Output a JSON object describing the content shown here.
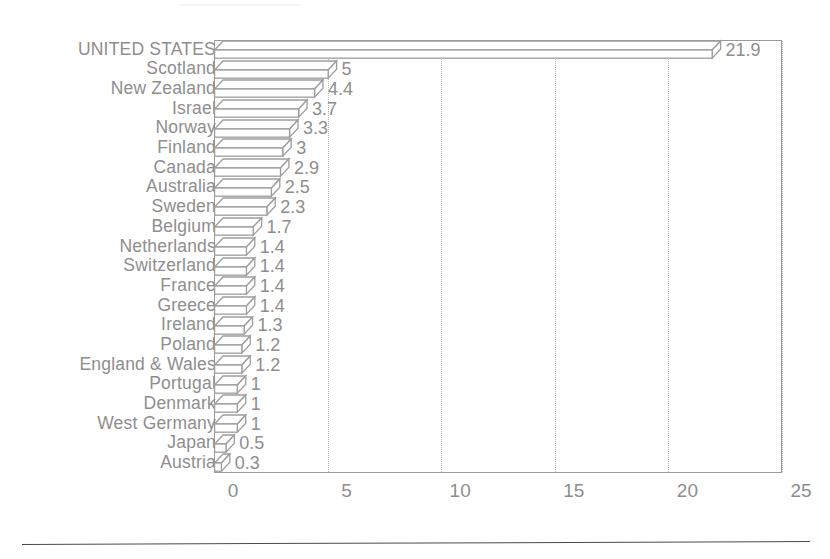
{
  "chart_data": {
    "type": "bar",
    "orientation": "horizontal",
    "title": "",
    "subtitle": "",
    "xlabel": "",
    "ylabel": "",
    "xlim": [
      0,
      25
    ],
    "grid": "dotted vertical gridlines at each x tick",
    "legend": "none",
    "x_ticks": [
      "0",
      "5",
      "10",
      "15",
      "20",
      "25"
    ],
    "x_tick_values": [
      0,
      5,
      10,
      15,
      20,
      25
    ],
    "categories": [
      "UNITED STATES",
      "Scotland",
      "New Zealand",
      "Israel",
      "Norway",
      "Finland",
      "Canada",
      "Australia",
      "Sweden",
      "Belgium",
      "Netherlands",
      "Switzerland",
      "France",
      "Greece",
      "Ireland",
      "Poland",
      "England & Wales",
      "Portugal",
      "Denmark",
      "West Germany",
      "Japan",
      "Austria"
    ],
    "values": [
      21.9,
      5,
      4.4,
      3.7,
      3.3,
      3,
      2.9,
      2.5,
      2.3,
      1.7,
      1.4,
      1.4,
      1.4,
      1.4,
      1.3,
      1.2,
      1.2,
      1,
      1,
      1,
      0.5,
      0.3
    ],
    "value_labels": [
      "21.9",
      "5",
      "4.4",
      "3.7",
      "3.3",
      "3",
      "2.9",
      "2.5",
      "2.3",
      "1.7",
      "1.4",
      "1.4",
      "1.4",
      "1.4",
      "1.3",
      "1.2",
      "1.2",
      "1",
      "1",
      "1",
      "0.5",
      "0.3"
    ]
  },
  "style": {
    "ink_color": "#8e8e8e",
    "bar_stroke": "#9d9d9d",
    "bar_fill": "#ffffff",
    "grid_color": "#bdbdbd",
    "frame_color": "#9a9a9a",
    "rule_color": "#4a4a4a",
    "background": "#ffffff"
  }
}
